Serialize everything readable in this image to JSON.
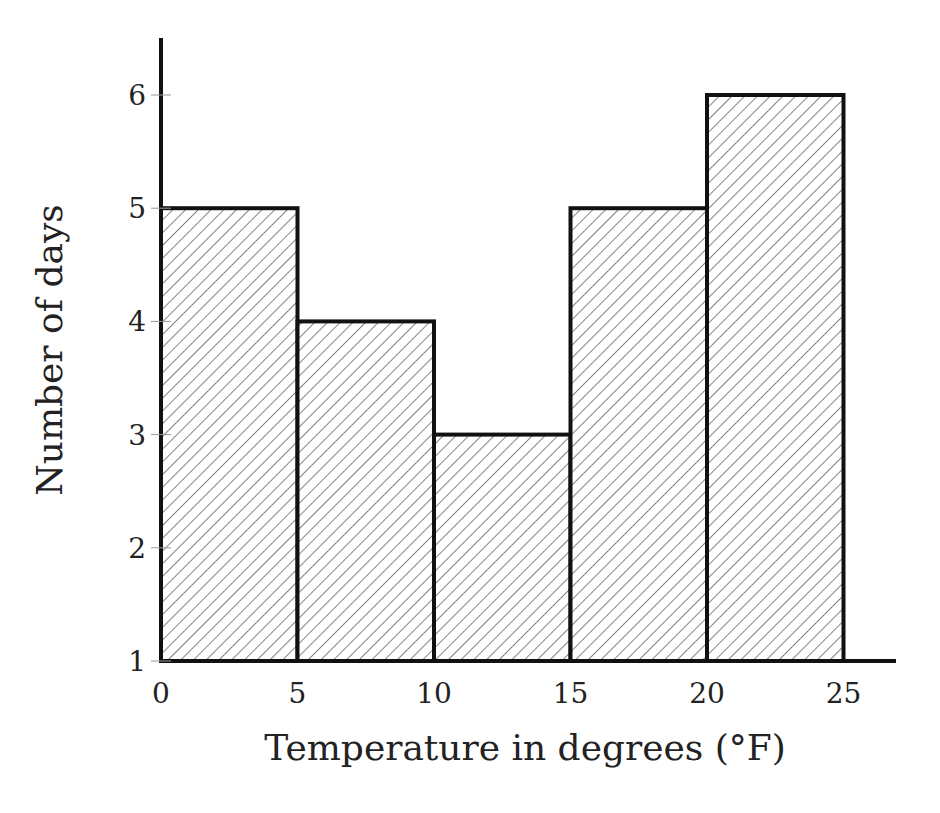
{
  "chart_data": {
    "type": "bar",
    "title": "",
    "xlabel": "Temperature in degrees (°F)",
    "ylabel": "Number of days",
    "bins": [
      [
        0,
        5
      ],
      [
        5,
        10
      ],
      [
        10,
        15
      ],
      [
        15,
        20
      ],
      [
        20,
        25
      ]
    ],
    "categories": [
      "0-5",
      "5-10",
      "10-15",
      "15-20",
      "20-25"
    ],
    "values": [
      5,
      4,
      3,
      5,
      6
    ],
    "x_ticks": [
      "0",
      "5",
      "10",
      "15",
      "20",
      "25"
    ],
    "y_ticks": [
      "1",
      "2",
      "3",
      "4",
      "5",
      "6"
    ],
    "ylim": [
      1,
      6.5
    ],
    "xlim": [
      0,
      27
    ],
    "grid": false,
    "fill": "diagonal hatch"
  }
}
